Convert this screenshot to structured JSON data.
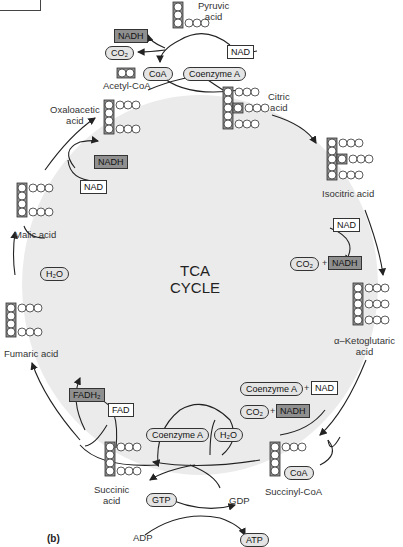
{
  "figure_label": "(b)",
  "title": {
    "line1": "TCA",
    "line2": "CYCLE"
  },
  "colors": {
    "cycle_fill": "#ebebeb",
    "dark_box": "#8f8f8f",
    "oval_fill": "#e4e4e4",
    "stroke": "#333333"
  },
  "molecules": {
    "pyruvic": {
      "line1": "Pyruvic",
      "line2": "acid"
    },
    "acetyl_coa": "Acetyl-CoA",
    "citric": {
      "line1": "Citric",
      "line2": "acid"
    },
    "isocitric": "Isocitric acid",
    "ketoglutaric": {
      "line1": "α–Ketoglutaric",
      "line2": "acid"
    },
    "succinyl_coa": "Succinyl-CoA",
    "succinic": {
      "line1": "Succinic",
      "line2": "acid"
    },
    "fumaric": "Fumaric acid",
    "malic": "Malic acid",
    "oxaloacetic": {
      "line1": "Oxaloacetic",
      "line2": "acid"
    }
  },
  "cofactors": {
    "nadh_top": "NADH",
    "co2_top": "CO₂",
    "coa_acetyl": "CoA",
    "nad_top": "NAD",
    "coenzyme_a_top": "Coenzyme A",
    "nadh_oxalo": "NADH",
    "nad_malic": "NAD",
    "h2o_left": "H₂O",
    "nad_isocitric": "NAD",
    "co2_isocitric": "CO₂",
    "nadh_isocitric": "NADH",
    "coenzyme_a_keto": "Coenzyme A",
    "nad_keto": "NAD",
    "co2_keto": "CO₂",
    "nadh_keto": "NADH",
    "coa_succinyl": "CoA",
    "coenzyme_a_bottom": "Coenzyme A",
    "h2o_bottom": "H₂O",
    "fadh2": "FADH₂",
    "fad": "FAD",
    "gtp": "GTP",
    "gdp": "GDP",
    "adp": "ADP",
    "atp": "ATP",
    "plus": "+"
  },
  "atoms": {
    "c": "C",
    "o": "O",
    "h": "H"
  }
}
